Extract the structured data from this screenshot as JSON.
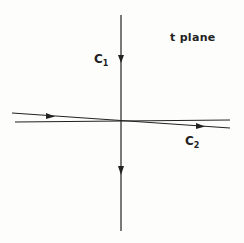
{
  "figure": {
    "plane_label": "t plane",
    "contours": [
      {
        "name": "C",
        "subscript": "1",
        "direction": "downward along imaginary axis"
      },
      {
        "name": "C",
        "subscript": "2",
        "direction": "left to right, slightly below real axis on the right, above on the left"
      }
    ]
  },
  "colors": {
    "ink": "#222222",
    "paper": "#fdfdfb"
  }
}
